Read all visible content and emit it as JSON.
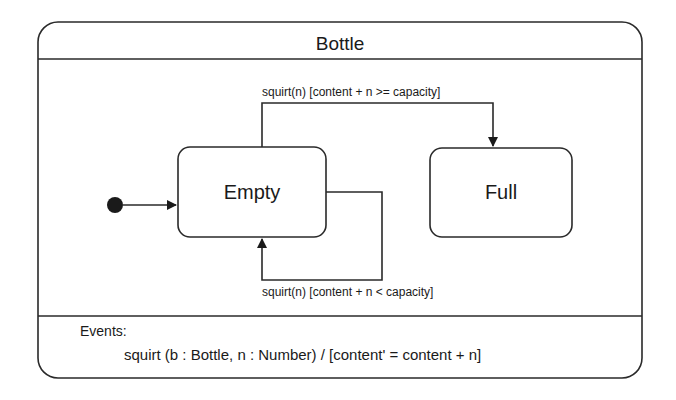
{
  "diagram": {
    "type": "uml-state-machine",
    "container": {
      "title": "Bottle"
    },
    "initial_state": {
      "label": ""
    },
    "states": [
      {
        "id": "empty",
        "label": "Empty"
      },
      {
        "id": "full",
        "label": "Full"
      }
    ],
    "transitions": [
      {
        "from": "initial",
        "to": "empty",
        "label": ""
      },
      {
        "from": "empty",
        "to": "full",
        "label": "squirt(n) [content + n >= capacity]"
      },
      {
        "from": "empty",
        "to": "empty",
        "label": "squirt(n) [content + n < capacity]"
      }
    ],
    "events": {
      "heading": "Events:",
      "items": [
        "squirt (b : Bottle, n : Number) / [content' = content + n]"
      ]
    }
  },
  "colors": {
    "stroke": "#2a2a2a",
    "text": "#1a1a1a",
    "background": "#ffffff"
  }
}
